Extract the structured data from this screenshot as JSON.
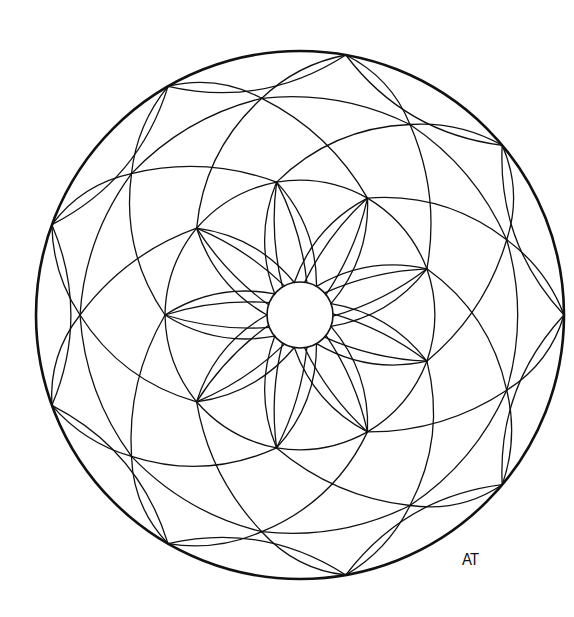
{
  "artwork": {
    "type": "mandala line-art coloring page",
    "symmetry": 9,
    "stroke_color": "#111111",
    "background_color": "#ffffff",
    "center": [
      300,
      315
    ],
    "outer_circle_radius": 264,
    "inner_circle_radius": 33,
    "petal_tip_radius": 135,
    "mid_node_radius": 220,
    "petal_start_angle_deg": 20,
    "touch_start_angle_deg": 0,
    "petal_count": 9
  },
  "signature": {
    "text": "AT"
  }
}
